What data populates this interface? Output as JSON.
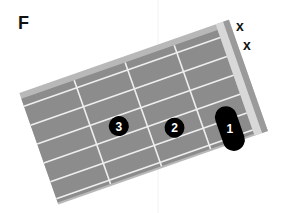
{
  "chord": {
    "name": "F",
    "instrument": "guitar",
    "strings": 6,
    "frets_shown": 4,
    "muted_strings": [
      6,
      5
    ],
    "muted_symbol": "x",
    "fingers": [
      {
        "finger": "1",
        "fret": 1,
        "strings": [
          1,
          2
        ],
        "type": "barre"
      },
      {
        "finger": "2",
        "fret": 2,
        "string": 3,
        "type": "dot"
      },
      {
        "finger": "3",
        "fret": 3,
        "string": 4,
        "type": "dot"
      }
    ]
  },
  "colors": {
    "fretboard": "#8c8c8c",
    "fretboard_edge": "#b8b8b8",
    "nut": "#d8d8d8",
    "lines": "#efefef",
    "finger_marker": "#000000",
    "finger_text": "#ffffff",
    "text": "#111111"
  },
  "labels": {
    "mute_1": "x",
    "mute_2": "x",
    "finger_1": "1",
    "finger_2": "2",
    "finger_3": "3"
  }
}
